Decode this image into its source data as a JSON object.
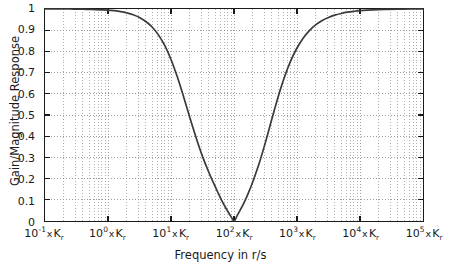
{
  "figure": {
    "background": "#ffffff",
    "axis_color": "#1a1a1a",
    "grid_color": "#8c8c8c",
    "curve_color": "#3a3a3a"
  },
  "axes": {
    "y_title": "Gain/Magnitude Response",
    "x_title": "Frequency in r/s",
    "y_ticklabels": [
      "1",
      "0.9",
      "0.8",
      "0.7",
      "0.6",
      "0.5",
      "0.4",
      "0.3",
      "0.2",
      "0.1",
      "0"
    ],
    "y_tickvalues": [
      1,
      0.9,
      0.8,
      0.7,
      0.6,
      0.5,
      0.4,
      0.3,
      0.2,
      0.1,
      0
    ],
    "x_ticklabels": [
      {
        "mantissa": "10",
        "exponent": "-1",
        "times": "x",
        "symbol": "K",
        "subscript": "r"
      },
      {
        "mantissa": "10",
        "exponent": "0",
        "times": "x",
        "symbol": "K",
        "subscript": "r"
      },
      {
        "mantissa": "10",
        "exponent": "1",
        "times": "x",
        "symbol": "K",
        "subscript": "r"
      },
      {
        "mantissa": "10",
        "exponent": "2",
        "times": "x",
        "symbol": "K",
        "subscript": "r"
      },
      {
        "mantissa": "10",
        "exponent": "3",
        "times": "x",
        "symbol": "K",
        "subscript": "r"
      },
      {
        "mantissa": "10",
        "exponent": "4",
        "times": "x",
        "symbol": "K",
        "subscript": "r"
      },
      {
        "mantissa": "10",
        "exponent": "5",
        "times": "x",
        "symbol": "K",
        "subscript": "r"
      }
    ],
    "x_tick_exponents": [
      -1,
      0,
      1,
      2,
      3,
      4,
      5
    ]
  },
  "chart_data": {
    "type": "line",
    "title": "",
    "subtitle": "",
    "xlabel": "Frequency in r/s",
    "ylabel": "Gain/Magnitude Response",
    "xscale": "log",
    "yscale": "linear",
    "xlim": [
      -1,
      5
    ],
    "ylim": [
      0,
      1
    ],
    "x_unit": "x K_r",
    "grid": true,
    "grid_style": "dotted",
    "legend": "none",
    "notch_center_decade": 2,
    "notch_center_label": "10^2 x K_r",
    "notch_min_value": 0,
    "series": [
      {
        "name": "Notch filter magnitude response",
        "x_log10": [
          -1.0,
          -0.9,
          -0.8,
          -0.7,
          -0.6,
          -0.5,
          -0.4,
          -0.3,
          -0.2,
          -0.1,
          0.0,
          0.1,
          0.2,
          0.3,
          0.4,
          0.5,
          0.6,
          0.7,
          0.8,
          0.9,
          1.0,
          1.1,
          1.2,
          1.3,
          1.4,
          1.5,
          1.6,
          1.7,
          1.75,
          1.8,
          1.85,
          1.9,
          1.95,
          2.0,
          2.05,
          2.1,
          2.15,
          2.2,
          2.25,
          2.3,
          2.4,
          2.5,
          2.6,
          2.7,
          2.8,
          2.9,
          3.0,
          3.1,
          3.2,
          3.3,
          3.4,
          3.5,
          3.6,
          3.7,
          3.8,
          3.9,
          4.0,
          4.2,
          4.4,
          4.6,
          4.8,
          5.0
        ],
        "y": [
          1.0,
          1.0,
          1.0,
          1.0,
          1.0,
          0.999,
          0.999,
          0.998,
          0.997,
          0.996,
          0.995,
          0.992,
          0.988,
          0.982,
          0.973,
          0.96,
          0.941,
          0.915,
          0.878,
          0.828,
          0.762,
          0.68,
          0.586,
          0.487,
          0.392,
          0.305,
          0.23,
          0.163,
          0.131,
          0.1,
          0.072,
          0.046,
          0.022,
          0.0,
          0.025,
          0.052,
          0.081,
          0.113,
          0.148,
          0.186,
          0.272,
          0.372,
          0.48,
          0.585,
          0.678,
          0.755,
          0.816,
          0.863,
          0.899,
          0.926,
          0.946,
          0.96,
          0.971,
          0.979,
          0.985,
          0.989,
          0.992,
          0.996,
          0.998,
          0.999,
          1.0,
          1.0
        ]
      }
    ]
  }
}
